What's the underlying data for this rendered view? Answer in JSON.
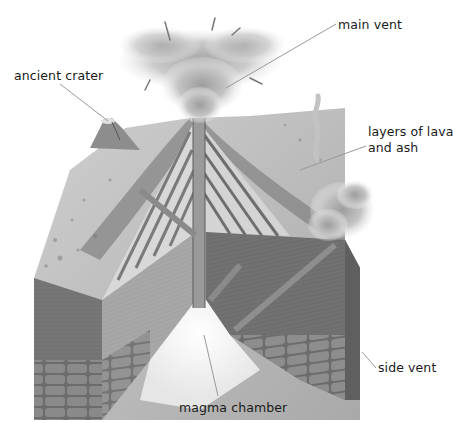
{
  "diagram": {
    "labels": [
      {
        "id": "main-vent",
        "text": "main vent",
        "x": 338,
        "y": 17
      },
      {
        "id": "ancient-crater",
        "text": "ancient crater",
        "x": 14,
        "y": 68
      },
      {
        "id": "layers",
        "text": "layers of lava",
        "text2": "and ash",
        "x": 368,
        "y": 124
      },
      {
        "id": "side-vent",
        "text": "side vent",
        "x": 378,
        "y": 360
      },
      {
        "id": "magma-chamber",
        "text": "magma chamber",
        "x": 179,
        "y": 400
      }
    ],
    "colors": {
      "label_text": "#1a1a1a",
      "leader_line": "#9a9a9a",
      "ground_top": "#b9b9b9",
      "strata_light": "#d8d8d8",
      "strata_dark": "#7c7c7c",
      "block_front_left": "#7a7a7a",
      "block_front_right": "#6e6e6e",
      "inner_wall": "#a6a6a6",
      "rock_base": "#5e5e5e",
      "smoke": "#c9c9c9"
    }
  }
}
